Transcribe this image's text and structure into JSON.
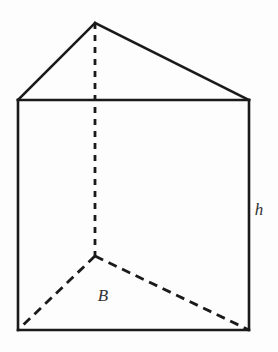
{
  "figure": {
    "name": "triangular-prism",
    "background_color": "#fdfdfd",
    "stroke_color": "#1a1a1a",
    "label_color": "#333333",
    "width": 278,
    "height": 352
  },
  "vertices": {
    "apex_back_top": {
      "x": 95,
      "y": 23
    },
    "front_top_left": {
      "x": 18,
      "y": 100
    },
    "front_top_right": {
      "x": 249,
      "y": 100
    },
    "front_bottom_left": {
      "x": 18,
      "y": 330
    },
    "front_bottom_right": {
      "x": 249,
      "y": 330
    },
    "apex_back_bottom": {
      "x": 95,
      "y": 256
    }
  },
  "edges": {
    "solid": [
      {
        "name": "top-face-left-edge",
        "points": "18,100 95,23"
      },
      {
        "name": "top-face-right-edge",
        "points": "95,23 249,100"
      },
      {
        "name": "front-top-edge",
        "points": "18,100 249,100"
      },
      {
        "name": "front-left-vertical-edge",
        "points": "18,100 18,330"
      },
      {
        "name": "front-right-vertical-edge",
        "points": "249,100 249,330"
      },
      {
        "name": "front-bottom-edge",
        "points": "18,330 249,330"
      }
    ],
    "hidden": [
      {
        "name": "hidden-back-vertical-edge",
        "points": "95,23 95,256",
        "style": "vertical"
      },
      {
        "name": "hidden-base-left-edge",
        "points": "95,256 18,330",
        "style": "diagonal"
      },
      {
        "name": "hidden-base-right-edge",
        "points": "95,256 249,330",
        "style": "diagonal"
      }
    ]
  },
  "labels": {
    "height": {
      "text": "h",
      "x": 259,
      "y": 211,
      "meaning": "prism height"
    },
    "base": {
      "text": "B",
      "x": 103,
      "y": 297,
      "meaning": "area of triangular base"
    }
  }
}
